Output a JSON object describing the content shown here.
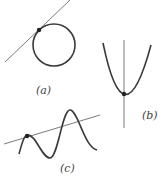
{
  "figure": {
    "panels": [
      {
        "id": "a",
        "label": "(a)",
        "description": "tangent line touching a circle at a point"
      },
      {
        "id": "b",
        "label": "(b)",
        "description": "vertical line touching a parabola at its vertex"
      },
      {
        "id": "c",
        "label": "(c)",
        "description": "line intersecting a wavy curve, tangent at one point"
      }
    ],
    "colors": {
      "curve": "#3a3a3a",
      "line": "#7a7a7a",
      "point": "#222222"
    }
  }
}
